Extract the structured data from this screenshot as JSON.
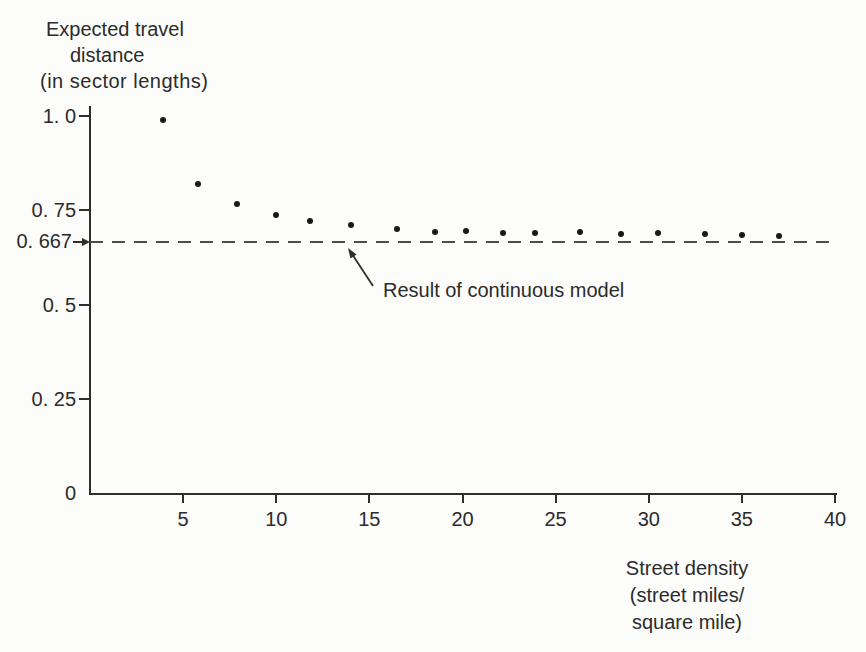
{
  "figure": {
    "background_color": "#fcfcfa",
    "ink_color": "#2b2b2b",
    "point_color": "#191919",
    "dashed_line_color": "#4c4c4c"
  },
  "chart_data": {
    "type": "scatter",
    "title": "",
    "ylabel": "Expected travel distance (in sector lengths)",
    "xlabel": "Street density (street miles/square mile)",
    "ylabel_lines": [
      "Expected travel",
      "distance",
      "(in sector lengths)"
    ],
    "xlabel_lines": [
      "Street density",
      "(street miles/",
      "square mile)"
    ],
    "x": [
      3.9,
      5.8,
      7.9,
      10.0,
      11.8,
      14.0,
      16.5,
      18.5,
      20.2,
      22.2,
      23.9,
      26.3,
      28.5,
      30.5,
      33.0,
      35.0,
      37.0
    ],
    "y": [
      0.99,
      0.82,
      0.767,
      0.737,
      0.722,
      0.711,
      0.7,
      0.693,
      0.695,
      0.69,
      0.69,
      0.692,
      0.687,
      0.69,
      0.687,
      0.684,
      0.682
    ],
    "xlim": [
      0,
      40
    ],
    "ylim": [
      0,
      1.03
    ],
    "xticks": [
      {
        "value": 5,
        "label": "5"
      },
      {
        "value": 10,
        "label": "10"
      },
      {
        "value": 15,
        "label": "15"
      },
      {
        "value": 20,
        "label": "20"
      },
      {
        "value": 25,
        "label": "25"
      },
      {
        "value": 30,
        "label": "30"
      },
      {
        "value": 35,
        "label": "35"
      },
      {
        "value": 40,
        "label": "40"
      }
    ],
    "yticks": [
      {
        "value": 1.0,
        "label": "1. 0",
        "has_mark": true
      },
      {
        "value": 0.75,
        "label": "0. 75",
        "has_mark": true
      },
      {
        "value": 0.5,
        "label": "0. 5",
        "has_mark": true
      },
      {
        "value": 0.25,
        "label": "0. 25",
        "has_mark": true
      },
      {
        "value": 0.0,
        "label": "0",
        "has_mark": false
      }
    ],
    "reference_line": {
      "y": 0.667,
      "label": "0. 667",
      "style": "dashed",
      "annotation": "Result of continuous model"
    },
    "grid": false,
    "legend": null
  }
}
